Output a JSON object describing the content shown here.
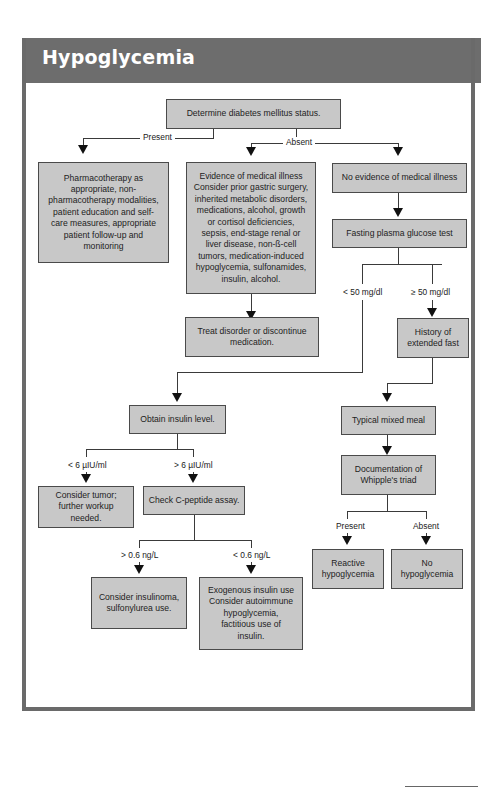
{
  "header": {
    "title": "Hypoglycemia"
  },
  "nodes": {
    "start": "Determine diabetes mellitus status.",
    "pharmacotherapy": "Pharmacotherapy as appropriate, non-pharmacotherapy modalities, patient education and self-care measures, appropriate patient follow-up and monitoring",
    "evidence": "Evidence of medical illness Consider prior gastric surgery, inherited metabolic disorders, medications, alcohol, growth or cortisol deficiencies, sepsis, end-stage renal or liver disease, non-ß-cell tumors, medication-induced hypoglycemia, sulfonamides, insulin, alcohol.",
    "no_evidence": "No evidence of medical illness",
    "fasting": "Fasting plasma glucose test",
    "treat": "Treat disorder or discontinue medication.",
    "history": "History of extended fast",
    "obtain_insulin": "Obtain insulin level.",
    "mixed_meal": "Typical mixed meal",
    "whipple": "Documentation of Whipple's triad",
    "tumor": "Consider tumor; further workup needed.",
    "cpeptide": "Check C-peptide assay.",
    "reactive": "Reactive hypoglycemia",
    "no_hypo": "No hypoglycemia",
    "insulinoma": "Consider insulinoma, sulfonylurea use.",
    "exogenous": "Exogenous insulin use Consider autoimmune hypoglycemia, factitious use of insulin."
  },
  "labels": {
    "present": "Present",
    "absent": "Absent",
    "lt50": "< 50 mg/dl",
    "ge50": "≥ 50 mg/dl",
    "lt6": "< 6 µIU/ml",
    "gt6": "> 6 µIU/ml",
    "gt06": "> 0.6 ng/L",
    "lt06": "< 0.6 ng/L",
    "whipple_present": "Present",
    "whipple_absent": "Absent"
  },
  "colors": {
    "header": "#6d6d6d",
    "node_fill": "#c8c8c8",
    "border": "#4a4a4a"
  }
}
